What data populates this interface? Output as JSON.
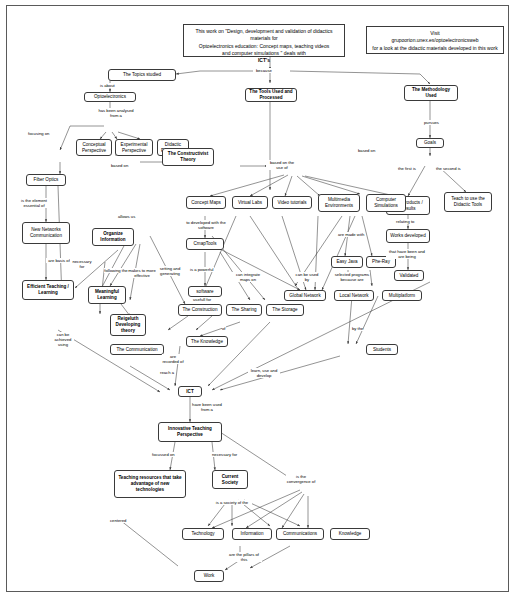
{
  "document": {
    "type": "concept-map",
    "banner_left": {
      "lines": [
        "This work on \"Design, development and validation of didactics materials for",
        "Optoelectronics education: Concept maps, teaching videos",
        "and computer simulations \" deals with",
        "ICT's"
      ]
    },
    "banner_right": {
      "lines": [
        "Visit",
        "grupoorion.unex.es/optoelectronicsweb",
        "for a look at the didactic materials developed in this work"
      ]
    }
  },
  "nodes": {
    "topics_studied": "The Topics studied",
    "optoelectronics": "Optoelectronics",
    "conceptual_perspective": "Conceptual Perspective",
    "experimental_perspective": "Experimental Perspective",
    "didactic_perspective": "Didactic Perspective",
    "fiber_optics": "Fiber Optics",
    "new_networks_communication": "New Networks Communication",
    "efficient_teaching_learning": "Efficient Teaching / Learning",
    "meaningful_learning": "Meaningful Learning",
    "reigeluth_theory": "Reigeluth Developing theory",
    "the_communication": "The Communication",
    "organize_information": "Organize Information",
    "tools_used": "The Tools Used and Processed",
    "methodology_used": "The Methodology Used",
    "constructivist_theory": "The Constructivist Theory",
    "goals": "Goals",
    "get_products_results": "Get Products / Results",
    "teach_didactic_tools": "Teach to use the Didactic Tools",
    "works_developed": "Works developed",
    "validated": "Validated",
    "concept_maps": "Concept Maps",
    "virtual_labs": "Virtual Labs",
    "video_tutorials": "Video tutorials",
    "multimedia_environments": "Multimedia Environments",
    "computer_simulations": "Computer Simulations",
    "cmaptools": "CmapTools",
    "software": "software",
    "easy_java": "Easy Java",
    "phe_ray": "Phe-Ray",
    "global_network": "Global Network",
    "local_network": "Local Network",
    "multiplatform": "Multiplatform",
    "the_construction": "The Construction",
    "the_sharing": "The Sharing",
    "the_storage": "The Storage",
    "the_knowledge": "The Knowledge",
    "students": "Students",
    "ict": "ICT",
    "innovative_teaching_perspective": "Innovative Teaching Perspective",
    "teaching_resources": "Teaching resources that take advantage of new technologies",
    "current_society": "Current Society",
    "technology": "Technology",
    "information": "Information",
    "communications": "Communications",
    "knowledge": "Knowledge",
    "work": "Work"
  },
  "link_labels": {
    "because": "because",
    "is_about": "is about",
    "has_been_analysed": "has been analysed from a",
    "focusing_on": "focusing on",
    "based_on": "based on",
    "is_the_element_essential": "is the element essential of",
    "are_basis_of": "are basis of",
    "necessary_for": "necessary for",
    "following_the": "following the",
    "makes_more_effective": "makes to more effective",
    "setting_and_generating": "setting and generating",
    "can_be_achieved_using": "can be achieved using",
    "allows_us": "allows us",
    "are_recorded_of": "are recorded of",
    "pursues": "pursues",
    "based_on2": "based on",
    "based_on_the_use_of": "based on the use of",
    "the_first_is": "the first is",
    "the_second_is": "the second is",
    "relating_to": "relating to",
    "that_have_been": "that have been and are being",
    "to_developed_with": "to developed with the software",
    "is_a_powerful": "is a powerful",
    "can_integrate_maps_on": "can integrate maps on",
    "usefull_for": "usefull for",
    "are_made_with": "are made with",
    "selected_programs": "selected programs because are",
    "can_be_used_by": "can be used by",
    "are": "are",
    "of": "of",
    "by_the": "by the",
    "reach_a": "reach a",
    "learn_use_and_develop": "learn, use and develop",
    "have_been_used_from_a": "have been used from a",
    "focussed_on": "focussed on",
    "necessary_for2": "necessary for",
    "is_the_convergence_of": "is the convergence of",
    "is_a_society_of_the": "is a society of the",
    "are_the_pillars_of_this": "are the pillars of this",
    "centered": "centered"
  },
  "colors": {
    "line": "#3a3a3a",
    "node_border": "#3a3a3a",
    "background": "#ffffff"
  }
}
